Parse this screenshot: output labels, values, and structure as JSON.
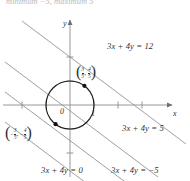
{
  "figure": {
    "title_cutoff_ghost": "minimum  −5, maximum 5",
    "axes": {
      "x_label": "x",
      "y_label": "y",
      "origin_label": "0",
      "x_unit_label": "1",
      "x_range": [
        -2.0,
        3.2
      ],
      "y_range": [
        -1.9,
        2.6
      ],
      "ticks_x": [
        -2,
        -1,
        1,
        2,
        3
      ],
      "ticks_y": [
        -1,
        1,
        2
      ],
      "grid": false
    },
    "circle": {
      "label": "unit-circle",
      "center": [
        0,
        0
      ],
      "radius": 1,
      "stroke": "#1c1c1c"
    },
    "lines": [
      {
        "id": "line-12",
        "equation": "3x + 4y = 12",
        "c": 12,
        "label": "3x + 4y = 12"
      },
      {
        "id": "line-5",
        "equation": "3x + 4y = 5",
        "c": 5,
        "label": "3x + 4y = 5"
      },
      {
        "id": "line-0",
        "equation": "3x + 4y = 0",
        "c": 0,
        "label": "3x + 4y = 0"
      },
      {
        "id": "line-neg5",
        "equation": "3x + 4y = -5",
        "c": -5,
        "label": "3x + 4y = −5"
      }
    ],
    "points": [
      {
        "id": "tangent-point-max",
        "x_num": "3",
        "x_den": "5",
        "y_num": "4",
        "y_den": "5",
        "sign": ""
      },
      {
        "id": "tangent-point-min",
        "x_num": "3",
        "x_den": "5",
        "y_num": "4",
        "y_den": "5",
        "sign": "−"
      }
    ],
    "colors": {
      "ink": "#30302f",
      "line": "#8a8a8a",
      "axis": "#8d8d8d",
      "circle": "#1c1c1c",
      "marker": "#141414"
    }
  }
}
